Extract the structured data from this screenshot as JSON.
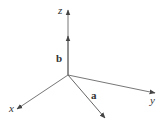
{
  "diagram": {
    "type": "3d-coordinate-axes",
    "origin": [
      68,
      75
    ],
    "axes": [
      {
        "name": "z",
        "label": "z",
        "end": [
          68,
          10
        ]
      },
      {
        "name": "x",
        "label": "x",
        "end": [
          17,
          109
        ]
      },
      {
        "name": "y",
        "label": "y",
        "end": [
          155,
          93
        ]
      }
    ],
    "vectors": [
      {
        "name": "b",
        "label": "b",
        "direction": "along z-axis",
        "tip": [
          68,
          36
        ]
      },
      {
        "name": "a",
        "label": "a",
        "direction": "in xy-plane",
        "tip": [
          105,
          118
        ]
      }
    ],
    "labels": {
      "z": "z",
      "x": "x",
      "y": "y",
      "a": "a",
      "b": "b"
    },
    "colors": {
      "axis": "#777777",
      "text": "#333333",
      "background": "#ffffff"
    }
  }
}
